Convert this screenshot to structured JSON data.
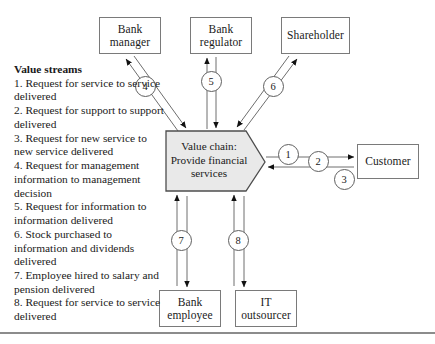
{
  "diagram": {
    "center_node": {
      "name": "value-chain",
      "label": "Value chain:\nProvide financial\nservices",
      "shape": "pentagon-arrow-right",
      "fill": "#e9e9e9",
      "stroke": "#4d4d4d"
    },
    "external_nodes": [
      {
        "id": "bank-manager",
        "label": "Bank\nmanager",
        "x": 99,
        "y": 17,
        "w": 62,
        "h": 37
      },
      {
        "id": "bank-regulator",
        "label": "Bank\nregulator",
        "x": 190,
        "y": 17,
        "w": 62,
        "h": 37
      },
      {
        "id": "shareholder",
        "label": "Shareholder",
        "x": 281,
        "y": 17,
        "w": 69,
        "h": 37
      },
      {
        "id": "customer",
        "label": "Customer",
        "x": 357,
        "y": 144,
        "w": 62,
        "h": 35
      },
      {
        "id": "bank-employee",
        "label": "Bank\nemployee",
        "x": 159,
        "y": 290,
        "w": 62,
        "h": 37
      },
      {
        "id": "it-outsourcer",
        "label": "IT\noutsourcer",
        "x": 235,
        "y": 290,
        "w": 62,
        "h": 37
      }
    ],
    "stream_badges": [
      {
        "id": "badge-1",
        "number": "1",
        "cx": 288,
        "cy": 154
      },
      {
        "id": "badge-2",
        "number": "2",
        "cx": 318,
        "cy": 161
      },
      {
        "id": "badge-3",
        "number": "3",
        "cx": 344,
        "cy": 179
      },
      {
        "id": "badge-4",
        "number": "4",
        "cx": 145,
        "cy": 86
      },
      {
        "id": "badge-5",
        "number": "5",
        "cx": 211,
        "cy": 81
      },
      {
        "id": "badge-6",
        "number": "6",
        "cx": 273,
        "cy": 86
      },
      {
        "id": "badge-7",
        "number": "7",
        "cx": 181,
        "cy": 240
      },
      {
        "id": "badge-8",
        "number": "8",
        "cx": 238,
        "cy": 240
      }
    ]
  },
  "legend": {
    "title": "Value streams",
    "items": [
      "1. Request for service to service delivered",
      "2. Request for support to support delivered",
      "3. Request for new service to new service delivered",
      "4. Request for management information to management decision",
      "5. Request for information to information delivered",
      "6. Stock purchased to information and dividends delivered",
      "7. Employee hired to salary and pension delivered",
      "8. Request for service to service delivered"
    ]
  }
}
